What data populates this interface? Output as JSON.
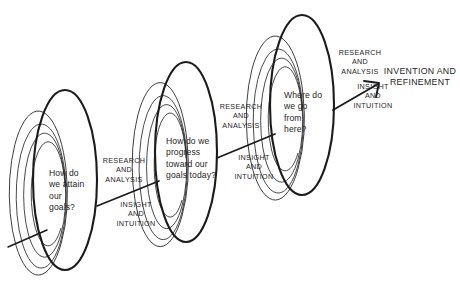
{
  "diagram": {
    "type": "process-spiral-diagram",
    "stroke_color": "#1b1b1b",
    "background_color": "#ffffff",
    "nodes": [
      {
        "id": "node-1",
        "label": "How do\nwe attain\nour\ngoals?",
        "cx": 65,
        "cy": 180,
        "rx": 32,
        "ry": 90
      },
      {
        "id": "node-2",
        "label": "How do we\nprogress\ntoward our\ngoals today?",
        "cx": 186,
        "cy": 152,
        "rx": 31,
        "ry": 90
      },
      {
        "id": "node-3",
        "label": "Where do\nwe go\nfrom\nhere?",
        "cx": 302,
        "cy": 105,
        "rx": 32,
        "ry": 90
      }
    ],
    "connectors": [
      {
        "id": "connector-1",
        "from": "node-1",
        "to": "node-2",
        "upper_label": "RESEARCH\nAND\nANALYSIS",
        "lower_label": "INSIGHT\nAND\nINTUITION",
        "arrowhead": false
      },
      {
        "id": "connector-2",
        "from": "node-2",
        "to": "node-3",
        "upper_label": "RESEARCH\nAND\nANALYSIS",
        "lower_label": "INSIGHT\nAND\nINTUITION",
        "arrowhead": false
      },
      {
        "id": "connector-3",
        "from": "node-3",
        "to": "outcome",
        "upper_label": "RESEARCH\nAND\nANALYSIS",
        "lower_label": "INSIGHT\nAND\nINTUITION",
        "arrowhead": true
      }
    ],
    "outcome": {
      "id": "outcome",
      "label": "INVENTION AND\nREFINEMENT"
    },
    "entry_line": {
      "id": "entry-line",
      "description": "incoming line at lower left entering first spiral"
    }
  }
}
